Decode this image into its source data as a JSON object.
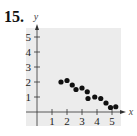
{
  "problem_number": "15.",
  "colors": {
    "background_panel": "#ececec",
    "axis": "#333333",
    "point": "#111111"
  },
  "chart_data": {
    "type": "scatter",
    "title": "",
    "xlabel": "x",
    "ylabel": "y",
    "xlim": [
      0,
      5.5
    ],
    "ylim": [
      0,
      5.5
    ],
    "x_ticks": [
      "1",
      "2",
      "3",
      "4",
      "5"
    ],
    "y_ticks": [
      "1",
      "2",
      "3",
      "4",
      "5"
    ],
    "grid": false,
    "legend": null,
    "points": [
      {
        "x": 1.6,
        "y": 2.0
      },
      {
        "x": 2.0,
        "y": 2.1
      },
      {
        "x": 2.35,
        "y": 1.8
      },
      {
        "x": 2.6,
        "y": 1.5
      },
      {
        "x": 3.0,
        "y": 1.6
      },
      {
        "x": 3.35,
        "y": 1.35
      },
      {
        "x": 3.4,
        "y": 0.9
      },
      {
        "x": 3.85,
        "y": 1.0
      },
      {
        "x": 4.25,
        "y": 0.9
      },
      {
        "x": 4.6,
        "y": 0.6
      },
      {
        "x": 4.9,
        "y": 0.3
      },
      {
        "x": 5.25,
        "y": 0.35
      }
    ]
  }
}
